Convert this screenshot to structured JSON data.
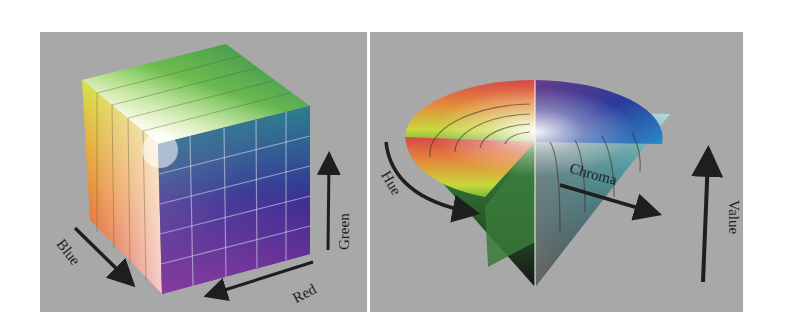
{
  "figure": {
    "left_panel": {
      "title": "RGB color cube",
      "axes": [
        {
          "label": "Blue",
          "direction": "down-right"
        },
        {
          "label": "Red",
          "direction": "down-left"
        },
        {
          "label": "Green",
          "direction": "up"
        }
      ],
      "colors": {
        "background": "#a8a8a8",
        "arrow": "#1e1e1e"
      }
    },
    "right_panel": {
      "title": "HSV color cone",
      "axes": [
        {
          "label": "Hue",
          "direction": "curved-around"
        },
        {
          "label": "Chroma",
          "direction": "outward-right"
        },
        {
          "label": "Value",
          "direction": "up"
        }
      ],
      "colors": {
        "background": "#a8a8a8",
        "arrow": "#1e1e1e"
      }
    }
  }
}
